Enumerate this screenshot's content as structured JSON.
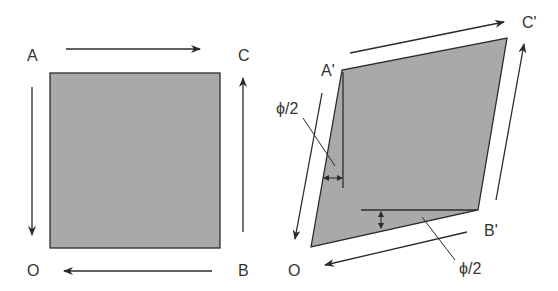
{
  "colors": {
    "fill": "#a9a9a9",
    "stroke": "#2b2b2b",
    "text": "#333333",
    "background": "#ffffff"
  },
  "left_figure": {
    "labels": {
      "A": "A",
      "C": "C",
      "O": "O",
      "B": "B"
    },
    "shape": "square",
    "arrows": [
      "A→C (top, rightward)",
      "A→O (left, downward)",
      "B→C (right, upward)",
      "B→O (bottom, leftward)"
    ]
  },
  "right_figure": {
    "labels": {
      "A": "A'",
      "C": "C'",
      "O": "O",
      "B": "B'"
    },
    "shape": "parallelogram (sheared square)",
    "angle_labels": {
      "left": "ϕ/2",
      "bottom": "ϕ/2"
    },
    "arrows": [
      "A'→C' (top, rightward)",
      "A'→O (left, downward)",
      "B'→C' (right, upward)",
      "B'→O (bottom, leftward)"
    ]
  }
}
